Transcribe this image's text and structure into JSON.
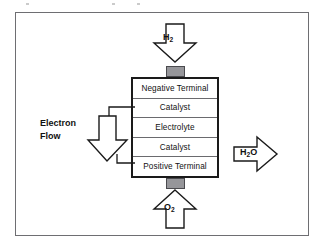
{
  "figure": {
    "background_color": "#ffffff",
    "frame_color": "#6e6e72",
    "stroke_color": "#1a1a1a",
    "tab_color": "#96969a"
  },
  "stack": {
    "name": "fuel-cell-stack",
    "layers": [
      {
        "label": "Negative Terminal"
      },
      {
        "label": "Catalyst"
      },
      {
        "label": "Electrolyte"
      },
      {
        "label": "Catalyst"
      },
      {
        "label": "Positive Terminal"
      }
    ]
  },
  "connectors": {
    "top_tab": "",
    "bottom_tab": ""
  },
  "flows": {
    "inlet_top": {
      "label_main": "H",
      "label_sub": "2",
      "direction": "down"
    },
    "inlet_bottom": {
      "label_main": "O",
      "label_sub": "2",
      "direction": "up"
    },
    "outlet_right": {
      "label_main": "H",
      "label_sub": "2",
      "label_tail": "O",
      "direction": "right"
    },
    "electron": {
      "label_line1": "Electron",
      "label_line2": "Flow",
      "direction": "down"
    }
  }
}
